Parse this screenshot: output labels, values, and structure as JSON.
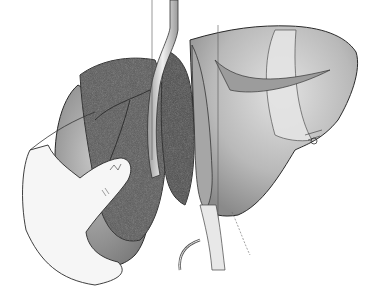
{
  "figure": {
    "style": "grayscale",
    "colors": {
      "background": "#ffffff",
      "outline": "#2a2a2a",
      "right_lobe": "#b8b8b8",
      "right_lobe_highlight": "#dcdcdc",
      "dark_segment": "#5a5a5a",
      "mid_segment": "#9a9a9a",
      "left_lobe": "#8e8e8e",
      "hand": "#f4f4f4",
      "vessel": "#d0d0d0",
      "ligament": "#e4e4e4"
    }
  }
}
